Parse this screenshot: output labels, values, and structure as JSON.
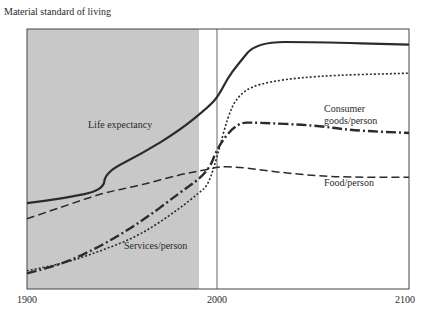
{
  "chart_data": {
    "type": "line",
    "title": "",
    "ylabel": "Material standard of living",
    "xlabel": "",
    "xlim": [
      1900,
      2100
    ],
    "x_ticks": [
      "1900",
      "2000",
      "2100"
    ],
    "grid": false,
    "legend": "inline annotations",
    "shaded_region": {
      "from": 1900,
      "to": 1990,
      "color": "#c8c8c8"
    },
    "vertical_marker": 2000,
    "series": [
      {
        "name": "Life expectancy",
        "style": "solid",
        "x": [
          1900,
          1920,
          1940,
          1941,
          1960,
          1980,
          1995,
          2000,
          2005,
          2010,
          2020,
          2050,
          2100
        ],
        "y": [
          0.33,
          0.35,
          0.38,
          0.45,
          0.52,
          0.61,
          0.7,
          0.74,
          0.81,
          0.86,
          0.95,
          0.95,
          0.94
        ]
      },
      {
        "name": "Consumer goods/person",
        "style": "dash-dot",
        "x": [
          1900,
          1920,
          1940,
          1960,
          1980,
          1995,
          2000,
          2010,
          2020,
          2050,
          2070,
          2100
        ],
        "y": [
          0.06,
          0.1,
          0.17,
          0.26,
          0.37,
          0.45,
          0.55,
          0.64,
          0.64,
          0.63,
          0.61,
          0.6
        ]
      },
      {
        "name": "Food/person",
        "style": "dashed",
        "x": [
          1900,
          1920,
          1940,
          1960,
          1980,
          1995,
          2000,
          2010,
          2030,
          2060,
          2100
        ],
        "y": [
          0.27,
          0.32,
          0.37,
          0.4,
          0.44,
          0.46,
          0.47,
          0.47,
          0.45,
          0.43,
          0.43
        ]
      },
      {
        "name": "Services/person",
        "style": "dotted",
        "x": [
          1900,
          1920,
          1940,
          1960,
          1980,
          1990,
          1995,
          2000,
          2005,
          2010,
          2020,
          2050,
          2100
        ],
        "y": [
          0.07,
          0.1,
          0.15,
          0.21,
          0.31,
          0.37,
          0.4,
          0.52,
          0.66,
          0.74,
          0.79,
          0.82,
          0.83
        ]
      }
    ],
    "annotations": [
      {
        "text": "Life expectancy",
        "x": 1930,
        "y": 0.6
      },
      {
        "text": "Consumer goods/person",
        "x": 2063,
        "y": 0.67
      },
      {
        "text": "Food/person",
        "x": 2063,
        "y": 0.38
      },
      {
        "text": "Services/person",
        "x": 1963,
        "y": 0.16
      }
    ]
  },
  "labels": {
    "ylabel": "Material standard of living",
    "tick_1900": "1900",
    "tick_2000": "2000",
    "tick_2100": "2100",
    "life": "Life expectancy",
    "consumer_1": "Consumer",
    "consumer_2": "goods/person",
    "food": "Food/person",
    "services": "Services/person"
  }
}
